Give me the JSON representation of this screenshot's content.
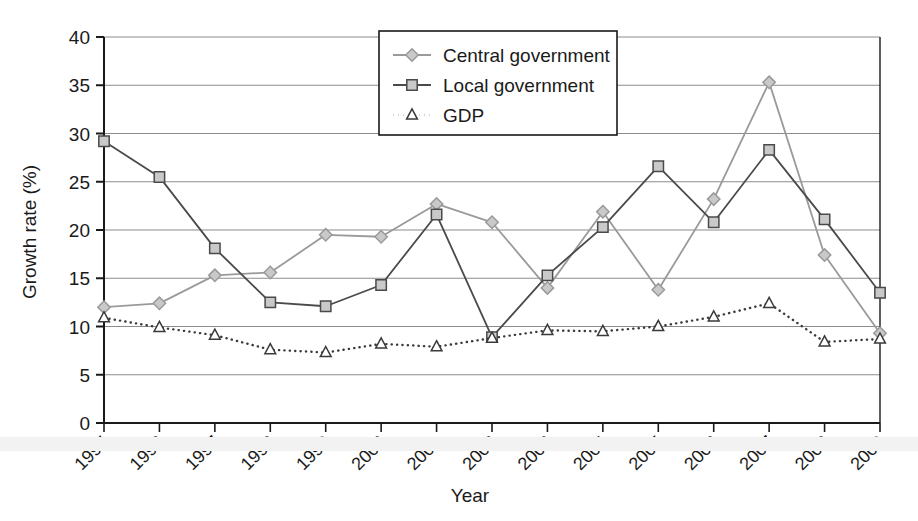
{
  "chart_data": {
    "type": "line",
    "title": "",
    "xlabel": "Year",
    "ylabel": "Growth rate (%)",
    "categories": [
      "1995",
      "1996",
      "1997",
      "1998",
      "1999",
      "2000",
      "2001",
      "2002",
      "2003",
      "2004",
      "2005",
      "2006",
      "2007",
      "2008",
      "2009"
    ],
    "x": [
      1995,
      1996,
      1997,
      1998,
      1999,
      2000,
      2001,
      2002,
      2003,
      2004,
      2005,
      2006,
      2007,
      2008,
      2009
    ],
    "ylim": [
      0,
      40
    ],
    "yticks": [
      0,
      5,
      10,
      15,
      20,
      25,
      30,
      35,
      40
    ],
    "grid": true,
    "legend_position": "top-center",
    "series": [
      {
        "name": "Central government",
        "marker": "diamond",
        "line_style": "solid",
        "color": "#9a9a9a",
        "marker_fill": "#c9c9c9",
        "values": [
          12.0,
          12.4,
          15.3,
          15.6,
          19.5,
          19.3,
          22.7,
          20.8,
          14.0,
          21.9,
          13.8,
          23.2,
          35.3,
          17.4,
          9.3
        ]
      },
      {
        "name": "Local government",
        "marker": "square",
        "line_style": "solid",
        "color": "#4a4a4a",
        "marker_fill": "#c9c9c9",
        "values": [
          29.2,
          25.5,
          18.1,
          12.5,
          12.1,
          14.3,
          21.6,
          8.9,
          15.3,
          20.3,
          26.6,
          20.8,
          28.3,
          21.1,
          13.5
        ]
      },
      {
        "name": "GDP",
        "marker": "triangle",
        "line_style": "dotted",
        "color": "#3a3a3a",
        "marker_fill": "#ffffff",
        "values": [
          10.9,
          9.9,
          9.1,
          7.6,
          7.3,
          8.2,
          7.9,
          8.8,
          9.6,
          9.5,
          10.0,
          11.0,
          12.4,
          8.4,
          8.7
        ]
      }
    ]
  },
  "axes": {
    "y_title": "Growth rate (%)",
    "x_title": "Year",
    "y_tick_labels": [
      "0",
      "5",
      "10",
      "15",
      "20",
      "25",
      "30",
      "35",
      "40"
    ],
    "x_tick_labels": [
      "1995",
      "1996",
      "1997",
      "1998",
      "1999",
      "2000",
      "2001",
      "2002",
      "2003",
      "2004",
      "2005",
      "2006",
      "2007",
      "2008",
      "2009"
    ]
  },
  "legend": {
    "items": [
      {
        "label": "Central government",
        "marker": "diamond-marker-icon"
      },
      {
        "label": "Local government",
        "marker": "square-marker-icon"
      },
      {
        "label": "GDP",
        "marker": "triangle-marker-icon"
      }
    ]
  },
  "colors": {
    "central": "#9a9a9a",
    "local": "#4a4a4a",
    "gdp": "#3a3a3a",
    "grid": "#8c8c8c",
    "axis": "#1a1a1a",
    "marker_fill": "#c9c9c9"
  }
}
